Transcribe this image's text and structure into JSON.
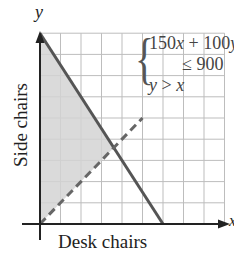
{
  "chart_data": {
    "type": "line",
    "title": "",
    "xlabel": "Desk chairs",
    "ylabel": "Side chairs",
    "x_var": "x",
    "y_var": "y",
    "xlim": [
      0,
      9
    ],
    "ylim": [
      0,
      9
    ],
    "grid": true,
    "series": [
      {
        "name": "150x + 100y = 900",
        "style": "solid",
        "points": [
          [
            0,
            9
          ],
          [
            6,
            0
          ]
        ]
      },
      {
        "name": "y = x",
        "style": "dashed",
        "points": [
          [
            0,
            0
          ],
          [
            5,
            5
          ]
        ]
      }
    ],
    "shaded_region": {
      "description": "solution region: 150x + 100y <= 900 and y > x",
      "vertices": [
        [
          0,
          0
        ],
        [
          3.6,
          3.6
        ],
        [
          0,
          9
        ]
      ],
      "color": "#d4d4d4"
    },
    "annotations": {
      "system": [
        "150x + 100y",
        "≤ 900",
        "y > x"
      ]
    }
  },
  "labels": {
    "xlabel": "Desk chairs",
    "ylabel": "Side chairs",
    "x_var": "x",
    "y_var": "y",
    "brace": "{",
    "ineq1_a": "150",
    "ineq1_b": "x",
    "ineq1_c": " + 100",
    "ineq1_d": "y",
    "ineq2": "≤ 900",
    "ineq3_a": "y",
    "ineq3_b": " > ",
    "ineq3_c": "x"
  },
  "colors": {
    "grid": "#bdbdbd",
    "shade": "#d4d4d4",
    "constraint_line": "#555555",
    "dashed_line": "#666666",
    "axis": "#222222"
  }
}
